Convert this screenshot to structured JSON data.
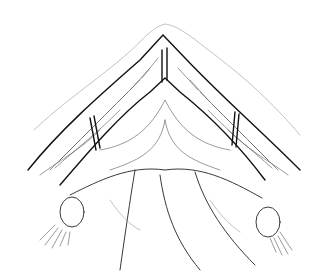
{
  "image": {
    "kind": "anatomical line illustration",
    "subject": "surgical view of pelvic anatomy with retracted tissue flaps forming an inverted V, sutures at apex and sides, ovaries and fimbriae at lower left and right",
    "style": "black ink line drawing on white background",
    "colors": {
      "background": "#ffffff",
      "ink": "#222222",
      "shading": "#bbbbbb"
    }
  }
}
